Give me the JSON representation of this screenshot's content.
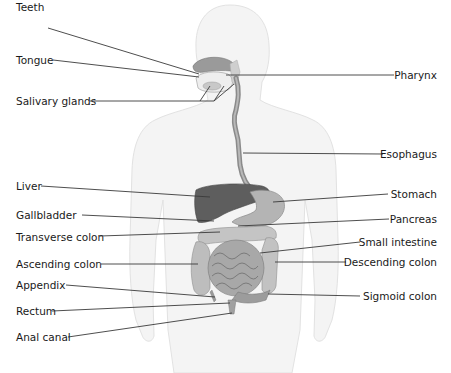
{
  "diagram": {
    "type": "anatomical-diagram",
    "colors": {
      "body_outline": "#e6e6e6",
      "body_fill": "#f4f4f4",
      "organ_dark": "#5a5a5a",
      "organ_mid": "#8c8c8c",
      "organ_light": "#b5b5b5",
      "leader_line": "#3a3a3a",
      "label_text": "#1a1a1a"
    },
    "labels_left": [
      {
        "id": "teeth",
        "text": "Teeth",
        "x": 16,
        "y": 21
      },
      {
        "id": "tongue",
        "text": "Tongue",
        "x": 16,
        "y": 54
      },
      {
        "id": "salivary-glands",
        "text": "Salivary glands",
        "x": 16,
        "y": 95
      },
      {
        "id": "liver",
        "text": "Liver",
        "x": 16,
        "y": 180
      },
      {
        "id": "gallbladder",
        "text": "Gallbladder",
        "x": 16,
        "y": 209
      },
      {
        "id": "transverse-colon",
        "text": "Transverse colon",
        "x": 16,
        "y": 231
      },
      {
        "id": "ascending-colon",
        "text": "Ascending colon",
        "x": 16,
        "y": 258
      },
      {
        "id": "appendix",
        "text": "Appendix",
        "x": 16,
        "y": 279
      },
      {
        "id": "rectum",
        "text": "Rectum",
        "x": 16,
        "y": 305
      },
      {
        "id": "anal-canal",
        "text": "Anal canal",
        "x": 16,
        "y": 331
      }
    ],
    "labels_right": [
      {
        "id": "pharynx",
        "text": "Pharynx",
        "right": 15,
        "y": 69
      },
      {
        "id": "esophagus",
        "text": "Esophagus",
        "right": 15,
        "y": 148
      },
      {
        "id": "stomach",
        "text": "Stomach",
        "right": 15,
        "y": 188
      },
      {
        "id": "pancreas",
        "text": "Pancreas",
        "right": 15,
        "y": 213
      },
      {
        "id": "small-intestine",
        "text": "Small intestine",
        "right": 15,
        "y": 236
      },
      {
        "id": "descending-colon",
        "text": "Descending colon",
        "right": 15,
        "y": 256
      },
      {
        "id": "sigmoid-colon",
        "text": "Sigmoid colon",
        "right": 15,
        "y": 290
      }
    ]
  }
}
